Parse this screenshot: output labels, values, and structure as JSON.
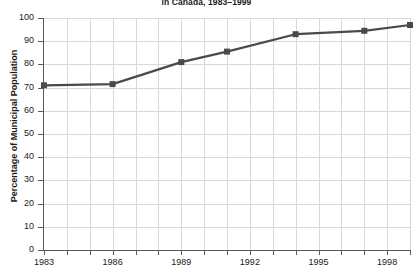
{
  "chart_data": {
    "type": "line",
    "title": "in Canada, 1983–1999",
    "xlabel": "",
    "ylabel": "Percentage of Municipal Population",
    "xlim": [
      1983,
      1999
    ],
    "ylim": [
      0,
      100
    ],
    "grid": true,
    "legend": "none",
    "x_tick_labels": [
      "1983",
      "1986",
      "1989",
      "1992",
      "1995",
      "1998"
    ],
    "x_tick_values": [
      1983,
      1986,
      1989,
      1992,
      1995,
      1998
    ],
    "x_minor_ticks": [
      1984,
      1985,
      1987,
      1988,
      1990,
      1991,
      1993,
      1994,
      1996,
      1997,
      1999
    ],
    "y_tick_labels": [
      "0",
      "10",
      "20",
      "30",
      "40",
      "50",
      "60",
      "70",
      "80",
      "90",
      "100"
    ],
    "y_tick_values": [
      0,
      10,
      20,
      30,
      40,
      50,
      60,
      70,
      80,
      90,
      100
    ],
    "series": [
      {
        "name": "Percentage of Municipal Population",
        "color": "#4a4a4a",
        "marker": "square",
        "x": [
          1983,
          1986,
          1989,
          1991,
          1994,
          1997,
          1999
        ],
        "values": [
          71,
          71.5,
          81,
          85.5,
          93,
          94.5,
          97
        ]
      }
    ]
  }
}
